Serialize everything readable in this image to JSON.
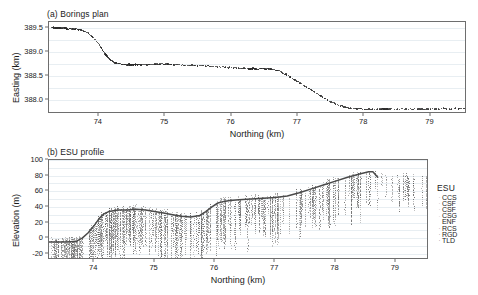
{
  "figure": {
    "width": 478,
    "height": 295,
    "background": "#ffffff"
  },
  "panel_a": {
    "title": "(a) Borings plan",
    "xlabel": "Northing (km)",
    "ylabel": "Easting (km)",
    "xticks": [
      "74",
      "75",
      "76",
      "77",
      "78",
      "79"
    ],
    "yticks": [
      "388.0",
      "388.5",
      "389.0",
      "389.5"
    ],
    "xlim": [
      73.25,
      79.55
    ],
    "ylim": [
      387.72,
      389.62
    ],
    "marker_color": "#2b2b2b"
  },
  "panel_b": {
    "title": "(b) ESU profile",
    "xlabel": "Northing (km)",
    "ylabel": "Elevation (m)",
    "xticks": [
      "74",
      "75",
      "76",
      "77",
      "78",
      "79"
    ],
    "yticks": [
      "-20",
      "0",
      "20",
      "40",
      "60",
      "80",
      "100"
    ],
    "xlim": [
      73.25,
      79.55
    ],
    "ylim": [
      -28,
      100
    ],
    "surface_color": "#4a4a4a"
  },
  "legend": {
    "title": "ESU",
    "items": [
      {
        "label": "CCS",
        "marker": "·",
        "color": "#9a9a9a"
      },
      {
        "label": "CSF",
        "marker": "·",
        "color": "#9a9a9a"
      },
      {
        "label": "CSF",
        "marker": "·",
        "color": "#a5a5a5"
      },
      {
        "label": "CSG",
        "marker": "·",
        "color": "#b0b0b0"
      },
      {
        "label": "ENF",
        "marker": "",
        "color": "#8a8a8a"
      },
      {
        "label": "RCS",
        "marker": "·",
        "color": "#6f6f6f"
      },
      {
        "label": "RGD",
        "marker": "·",
        "color": "#5f5f5f"
      },
      {
        "label": "TLD",
        "marker": "·",
        "color": "#4f4f4f"
      }
    ]
  },
  "chart_data": {
    "type": "scatter",
    "panels": [
      {
        "id": "a",
        "type": "scatter",
        "title": "(a) Borings plan",
        "xlabel": "Northing (km)",
        "ylabel": "Easting (km)",
        "xlim": [
          73.25,
          79.55
        ],
        "ylim": [
          387.72,
          389.62
        ],
        "xticks": [
          74,
          75,
          76,
          77,
          78,
          79
        ],
        "yticks": [
          388.0,
          388.5,
          389.0,
          389.5
        ],
        "grid": true,
        "legend": "none",
        "series": [
          {
            "name": "Boring locations",
            "marker": "dot",
            "color": "#2b2b2b",
            "x": [
              73.28,
              73.32,
              73.35,
              73.38,
              73.41,
              73.44,
              73.47,
              73.5,
              73.53,
              73.56,
              73.59,
              73.62,
              73.65,
              73.68,
              73.71,
              73.75,
              73.79,
              73.83,
              73.87,
              73.91,
              73.95,
              73.99,
              74.02,
              74.05,
              74.08,
              74.1,
              74.12,
              74.14,
              74.16,
              74.18,
              74.21,
              74.24,
              74.27,
              74.3,
              74.34,
              74.38,
              74.42,
              74.46,
              74.5,
              74.53,
              74.56,
              74.59,
              74.62,
              74.66,
              74.7,
              74.74,
              74.78,
              74.82,
              74.86,
              74.9,
              74.94,
              74.98,
              75.02,
              75.06,
              75.1,
              75.16,
              75.22,
              75.28,
              75.34,
              75.4,
              75.46,
              75.52,
              75.58,
              75.64,
              75.7,
              75.76,
              75.82,
              75.88,
              75.94,
              76.0,
              76.06,
              76.12,
              76.18,
              76.24,
              76.3,
              76.34,
              76.38,
              76.42,
              76.46,
              76.5,
              76.55,
              76.6,
              76.65,
              76.7,
              76.75,
              76.8,
              76.86,
              76.92,
              76.98,
              77.04,
              77.1,
              77.16,
              77.22,
              77.28,
              77.34,
              77.4,
              77.46,
              77.52,
              77.58,
              77.64,
              77.7,
              77.76,
              77.82,
              77.88,
              77.94,
              78.0,
              78.08,
              78.16,
              78.24,
              78.32,
              78.4,
              78.48,
              78.56,
              78.64,
              78.72,
              78.8,
              78.88,
              78.96,
              79.04,
              79.12,
              79.2,
              79.28,
              79.36,
              79.44,
              79.5
            ],
            "y": [
              389.52,
              389.52,
              389.51,
              389.52,
              389.51,
              389.5,
              389.51,
              389.5,
              389.49,
              389.5,
              389.49,
              389.48,
              389.49,
              389.47,
              389.48,
              389.45,
              389.43,
              389.4,
              389.36,
              389.31,
              389.25,
              389.18,
              389.12,
              389.05,
              388.99,
              388.95,
              388.92,
              388.89,
              388.86,
              388.84,
              388.81,
              388.79,
              388.78,
              388.77,
              388.76,
              388.76,
              388.75,
              388.76,
              388.75,
              388.76,
              388.75,
              388.76,
              388.75,
              388.76,
              388.75,
              388.76,
              388.75,
              388.76,
              388.77,
              388.76,
              388.78,
              388.76,
              388.77,
              388.76,
              388.75,
              388.76,
              388.75,
              388.74,
              388.75,
              388.74,
              388.73,
              388.74,
              388.72,
              388.73,
              388.71,
              388.72,
              388.7,
              388.71,
              388.69,
              388.7,
              388.68,
              388.67,
              388.68,
              388.66,
              388.67,
              388.68,
              388.66,
              388.67,
              388.68,
              388.66,
              388.67,
              388.66,
              388.65,
              388.63,
              388.6,
              388.56,
              388.51,
              388.46,
              388.41,
              388.36,
              388.31,
              388.26,
              388.21,
              388.16,
              388.11,
              388.06,
              388.01,
              387.97,
              387.93,
              387.9,
              387.88,
              387.86,
              387.85,
              387.84,
              387.84,
              387.83,
              387.84,
              387.83,
              387.84,
              387.83,
              387.84,
              387.83,
              387.84,
              387.83,
              387.84,
              387.84,
              387.83,
              387.84,
              387.85,
              387.84,
              387.85,
              387.84,
              387.85,
              387.84,
              387.85
            ]
          }
        ]
      },
      {
        "id": "b",
        "type": "scatter",
        "title": "(b) ESU profile",
        "xlabel": "Northing (km)",
        "ylabel": "Elevation (m)",
        "xlim": [
          73.25,
          79.55
        ],
        "ylim": [
          -28,
          100
        ],
        "xticks": [
          74,
          75,
          76,
          77,
          78,
          79
        ],
        "yticks": [
          -20,
          0,
          20,
          40,
          60,
          80,
          100
        ],
        "grid": true,
        "legend": "right",
        "legend_title": "ESU",
        "series": [
          {
            "name": "Ground surface",
            "type": "line",
            "color": "#4a4a4a",
            "x": [
              73.25,
              73.4,
              73.55,
              73.7,
              73.8,
              73.9,
              74.0,
              74.08,
              74.16,
              74.24,
              74.32,
              74.4,
              74.55,
              74.7,
              74.85,
              75.0,
              75.15,
              75.3,
              75.45,
              75.6,
              75.75,
              75.85,
              75.95,
              76.05,
              76.15,
              76.25,
              76.4,
              76.6,
              76.8,
              77.0,
              77.2,
              77.4,
              77.6,
              77.8,
              78.0,
              78.2,
              78.4,
              78.55,
              78.62,
              78.7
            ],
            "y": [
              -5,
              -5,
              -5,
              -4,
              0,
              7,
              16,
              25,
              31,
              34,
              35,
              36,
              36,
              37,
              36,
              34,
              32,
              30,
              28,
              27,
              29,
              34,
              40,
              45,
              47,
              48,
              49,
              50,
              51,
              52,
              54,
              58,
              63,
              68,
              73,
              78,
              82,
              85,
              85,
              78
            ]
          },
          {
            "name": "CCS",
            "type": "borehole-points",
            "color": "#9a9a9a",
            "description": "Engineering soil unit logged intervals plotted as vertical dotted columns at each boring location"
          },
          {
            "name": "CSF",
            "type": "borehole-points",
            "color": "#a5a5a5",
            "description": "Engineering soil unit logged intervals"
          },
          {
            "name": "CSG",
            "type": "borehole-points",
            "color": "#b0b0b0",
            "description": "Engineering soil unit logged intervals"
          },
          {
            "name": "ENF",
            "type": "borehole-points",
            "color": "#8a8a8a",
            "description": "Engineering soil unit logged intervals"
          },
          {
            "name": "RCS",
            "type": "borehole-points",
            "color": "#6f6f6f",
            "description": "Engineering rock unit logged intervals"
          },
          {
            "name": "RGD",
            "type": "borehole-points",
            "color": "#5f5f5f",
            "description": "Engineering rock unit logged intervals"
          },
          {
            "name": "TLD",
            "type": "borehole-points",
            "color": "#4f4f4f",
            "description": "Engineering unit logged intervals"
          }
        ]
      }
    ]
  }
}
